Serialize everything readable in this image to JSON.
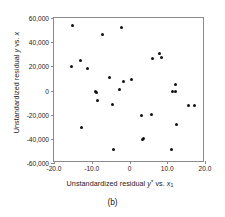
{
  "chart_data": {
    "type": "scatter",
    "title": "",
    "caption": "(b)",
    "xlabel_html": "Unstandardized residual <i>y</i><sup>*</sup> vs. <i>x</i><sub>1</sub>",
    "xlabel_text": "Unstandardized residual y* vs. x1",
    "ylabel_html": "Unstandardized residual <i>y</i> vs. <i>x</i>",
    "ylabel_text": "Unstandardized residual y vs. x",
    "xlim": [
      -20.0,
      20.0
    ],
    "ylim": [
      -60000,
      60000
    ],
    "xticks": [
      -20.0,
      -10.0,
      0,
      10.0,
      20.0
    ],
    "xticklabels": [
      "-20.0",
      "-10.0",
      "0",
      "10.0",
      "20.0"
    ],
    "yticks": [
      60000,
      40000,
      20000,
      0,
      -20000,
      -40000,
      -60000
    ],
    "yticklabels": [
      "60,000",
      "40,000",
      "20,000",
      "0",
      "-20,000",
      "-40,000",
      "-60,000"
    ],
    "grid": false,
    "legend": false,
    "marker_color": "#111111",
    "frame_color": "#8a8a8a",
    "points": [
      {
        "x": -15.2,
        "y": 53500
      },
      {
        "x": -15.3,
        "y": 20000
      },
      {
        "x": -13.0,
        "y": 25000
      },
      {
        "x": -12.6,
        "y": -30500
      },
      {
        "x": -11.2,
        "y": 18000
      },
      {
        "x": -9.0,
        "y": -1200
      },
      {
        "x": -8.7,
        "y": -1800
      },
      {
        "x": -8.6,
        "y": -8000
      },
      {
        "x": -7.2,
        "y": 46500
      },
      {
        "x": -5.3,
        "y": 11000
      },
      {
        "x": -4.4,
        "y": -11500
      },
      {
        "x": -4.2,
        "y": -48500
      },
      {
        "x": -2.6,
        "y": 1000
      },
      {
        "x": -2.0,
        "y": 52000
      },
      {
        "x": -1.7,
        "y": 7500
      },
      {
        "x": 0.6,
        "y": 9500
      },
      {
        "x": 3.3,
        "y": -20500
      },
      {
        "x": 3.5,
        "y": -40500
      },
      {
        "x": 3.8,
        "y": -39500
      },
      {
        "x": 5.9,
        "y": -20000
      },
      {
        "x": 6.1,
        "y": 26500
      },
      {
        "x": 8.0,
        "y": 31000
      },
      {
        "x": 8.4,
        "y": 27000
      },
      {
        "x": 11.0,
        "y": -49000
      },
      {
        "x": 11.3,
        "y": -1000
      },
      {
        "x": 12.2,
        "y": -1200
      },
      {
        "x": 12.3,
        "y": 5000
      },
      {
        "x": 12.5,
        "y": -28000
      },
      {
        "x": 15.6,
        "y": -12500
      },
      {
        "x": 17.2,
        "y": -12000
      }
    ]
  }
}
